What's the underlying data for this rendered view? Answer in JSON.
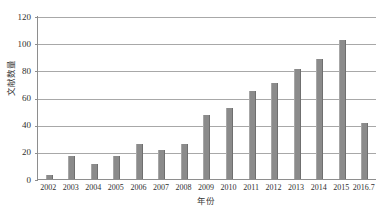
{
  "chart_data": {
    "type": "bar",
    "title": "",
    "xlabel": "年份",
    "ylabel": "文献数量",
    "categories": [
      "2002",
      "2003",
      "2004",
      "2005",
      "2006",
      "2007",
      "2008",
      "2009",
      "2010",
      "2011",
      "2012",
      "2013",
      "2014",
      "2015",
      "2016.7"
    ],
    "values": [
      3,
      17,
      11,
      17,
      26,
      21,
      26,
      47,
      52,
      65,
      71,
      81,
      88,
      102,
      41
    ],
    "series": [
      {
        "name": "文献数量",
        "values": [
          3,
          17,
          11,
          17,
          26,
          21,
          26,
          47,
          52,
          65,
          71,
          81,
          88,
          102,
          41
        ]
      }
    ],
    "ylim": [
      0,
      120
    ],
    "yticks": [
      0,
      20,
      40,
      60,
      80,
      100,
      120
    ],
    "ytick_labels": [
      "0",
      "20",
      "40",
      "60",
      "80",
      "100",
      "120"
    ],
    "grid": true,
    "legend": false,
    "bar_color": "#8b8b8b",
    "grid_color": "#a8a8a8",
    "axis_color": "#8e8e8e",
    "background": "#ffffff"
  }
}
